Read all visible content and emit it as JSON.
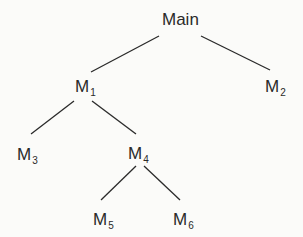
{
  "diagram": {
    "type": "tree",
    "nodes": [
      {
        "id": "main",
        "label": "Main",
        "sub": ""
      },
      {
        "id": "m1",
        "label": "M",
        "sub": "1"
      },
      {
        "id": "m2",
        "label": "M",
        "sub": "2"
      },
      {
        "id": "m3",
        "label": "M",
        "sub": "3"
      },
      {
        "id": "m4",
        "label": "M",
        "sub": "4"
      },
      {
        "id": "m5",
        "label": "M",
        "sub": "5"
      },
      {
        "id": "m6",
        "label": "M",
        "sub": "6"
      }
    ],
    "edges": [
      {
        "from": "main",
        "to": "m1"
      },
      {
        "from": "main",
        "to": "m2"
      },
      {
        "from": "m1",
        "to": "m3"
      },
      {
        "from": "m1",
        "to": "m4"
      },
      {
        "from": "m4",
        "to": "m5"
      },
      {
        "from": "m4",
        "to": "m6"
      }
    ]
  }
}
